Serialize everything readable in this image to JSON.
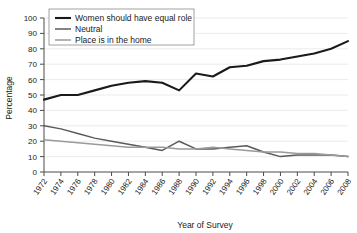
{
  "chart_data": {
    "type": "line",
    "title": "",
    "subtitle": "",
    "xlabel": "Year of Survey",
    "ylabel": "Percentage",
    "xlim": [
      1972,
      2008
    ],
    "ylim": [
      0,
      100
    ],
    "grid": true,
    "legend_position": "top-left",
    "x": [
      1972,
      1974,
      1976,
      1978,
      1980,
      1982,
      1984,
      1986,
      1988,
      1990,
      1992,
      1994,
      1996,
      1998,
      2000,
      2002,
      2004,
      2006,
      2008
    ],
    "xtick_labels": [
      "1972",
      "1974",
      "1976",
      "1978",
      "1980",
      "1982",
      "1984",
      "1986",
      "1988",
      "1990",
      "1992",
      "1994",
      "1996",
      "1998",
      "2000",
      "2002",
      "2004",
      "2006",
      "2008"
    ],
    "ytick_labels": [
      "0",
      "10",
      "20",
      "30",
      "40",
      "50",
      "60",
      "70",
      "80",
      "90",
      "100"
    ],
    "ytick_values": [
      0,
      10,
      20,
      30,
      40,
      50,
      60,
      70,
      80,
      90,
      100
    ],
    "series": [
      {
        "name": "Women should have equal role",
        "color": "#1a1a1a",
        "width": 2.1,
        "values": [
          47,
          50,
          50,
          53,
          56,
          58,
          59,
          58,
          53,
          64,
          62,
          68,
          69,
          72,
          73,
          75,
          77,
          80,
          85
        ]
      },
      {
        "name": "Neutral",
        "color": "#5a5a5a",
        "width": 1.5,
        "values": [
          30,
          28,
          25,
          22,
          20,
          18,
          16,
          14,
          20,
          15,
          15,
          16,
          17,
          13,
          10,
          11,
          11,
          11,
          10
        ]
      },
      {
        "name": "Place is in the home",
        "color": "#9a9a9a",
        "width": 1.5,
        "values": [
          21,
          20,
          19,
          18,
          17,
          16,
          16,
          16,
          15,
          15,
          16,
          15,
          14,
          13,
          13,
          12,
          12,
          11,
          10
        ]
      }
    ]
  },
  "legend": {
    "items": [
      {
        "label": "Women should have equal role"
      },
      {
        "label": "Neutral"
      },
      {
        "label": "Place is in the home"
      }
    ]
  }
}
